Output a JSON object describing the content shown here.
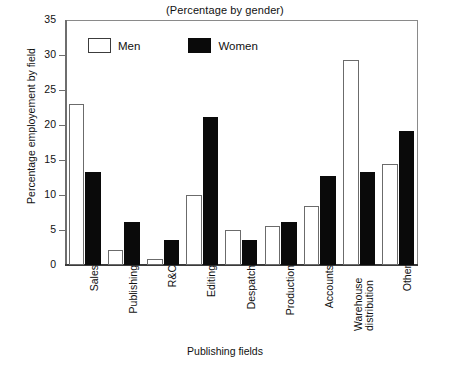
{
  "chart_data": {
    "type": "bar",
    "title": "(Percentage by gender)",
    "xlabel": "Publishing fields",
    "ylabel": "Percentage employement by field",
    "categories": [
      "Sales",
      "Publishing",
      "R&C",
      "Editing",
      "Despatch",
      "Production",
      "Accounts",
      "Warehouse distribution",
      "Other"
    ],
    "series": [
      {
        "name": "Men",
        "color": "#ffffff",
        "values": [
          23.0,
          2.2,
          0.8,
          10.0,
          5.0,
          5.6,
          8.4,
          29.3,
          14.5
        ]
      },
      {
        "name": "Women",
        "color": "#000000",
        "values": [
          13.3,
          6.2,
          3.6,
          21.2,
          3.6,
          6.1,
          12.7,
          13.3,
          19.2
        ]
      }
    ],
    "ylim": [
      0,
      35
    ],
    "yticks": [
      0,
      5,
      10,
      15,
      20,
      25,
      30,
      35
    ],
    "ytick_labels": [
      "0",
      "5",
      "10",
      "15",
      "20",
      "25",
      "30",
      "35"
    ],
    "grid": false,
    "legend_position": "top-left-inside"
  },
  "legend": {
    "men_label": "Men",
    "women_label": "Women"
  },
  "xlabels_display": [
    {
      "text": "Sales",
      "lines": [
        "Sales"
      ]
    },
    {
      "text": "Publishing",
      "lines": [
        "Publishing"
      ]
    },
    {
      "text": "R&C",
      "lines": [
        "R&C"
      ]
    },
    {
      "text": "Editing",
      "lines": [
        "Editing"
      ]
    },
    {
      "text": "Despatch",
      "lines": [
        "Despatch"
      ]
    },
    {
      "text": "Production",
      "lines": [
        "Production"
      ]
    },
    {
      "text": "Accounts",
      "lines": [
        "Accounts"
      ]
    },
    {
      "text": "Warehouse distribution",
      "lines": [
        "Warehouse",
        "distribution"
      ]
    },
    {
      "text": "Other",
      "lines": [
        "Other"
      ]
    }
  ]
}
